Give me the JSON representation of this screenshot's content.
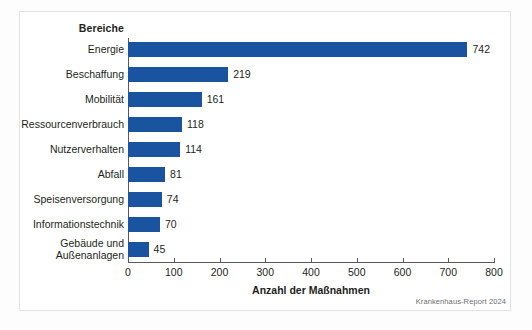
{
  "figure": {
    "background": "#fdfdfd",
    "frame_color": "#e2e2e2",
    "source_note": "Krankenhaus-Report 2024"
  },
  "chart_data": {
    "type": "bar",
    "orientation": "horizontal",
    "title": "",
    "xlabel": "Anzahl der Maßnahmen",
    "ylabel": "Bereiche",
    "categories": [
      "Energie",
      "Beschaffung",
      "Mobilität",
      "Ressourcenverbrauch",
      "Nutzerverhalten",
      "Abfall",
      "Speisenversorgung",
      "Informationstechnik",
      "Gebäude und\nAußenanlagen"
    ],
    "values": [
      742,
      219,
      161,
      118,
      114,
      81,
      74,
      70,
      45
    ],
    "value_labels": [
      "742",
      "219",
      "161",
      "118",
      "114",
      "81",
      "74",
      "70",
      "45"
    ],
    "xlim": [
      0,
      800
    ],
    "xticks": [
      0,
      100,
      200,
      300,
      400,
      500,
      600,
      700,
      800
    ],
    "xtick_labels": [
      "0",
      "100",
      "200",
      "300",
      "400",
      "500",
      "600",
      "700",
      "800"
    ],
    "grid": false,
    "legend": null,
    "bar_color": "#1a54a0",
    "text_color": "#231f20",
    "axis_color": "#58595b"
  }
}
